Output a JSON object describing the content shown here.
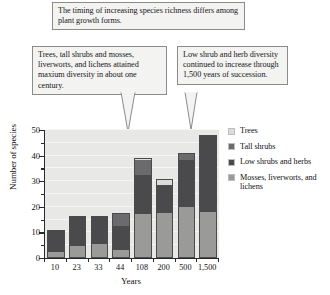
{
  "callouts": [
    {
      "id": "top",
      "text": "The timing of increasing species richness differs among plant growth forms."
    },
    {
      "id": "left",
      "text": "Trees, tall shrubs and mosses, liverworts, and lichens attained maxium diversity in about one century."
    },
    {
      "id": "right",
      "text": "Low shrub and herb diversity continued to increase through 1,500 years of succession."
    }
  ],
  "legend": {
    "items": [
      {
        "label": "Trees",
        "color": "#dcdcd9"
      },
      {
        "label": "Tall shrubs",
        "color": "#6b6b6e"
      },
      {
        "label": "Low shrubs and herbs",
        "color": "#4a4a4d"
      },
      {
        "label": "Mosses, liverworts, and lichens",
        "color": "#9a9a98"
      }
    ]
  },
  "chart_data": {
    "type": "bar",
    "title": "",
    "xlabel": "Years",
    "ylabel": "Number of species",
    "ylim": [
      0,
      50
    ],
    "yticks": [
      0,
      10,
      20,
      30,
      40,
      50
    ],
    "yminor": [
      5,
      15,
      25,
      35,
      45
    ],
    "grid": true,
    "stacked": true,
    "legend_position": "right",
    "categories": [
      "10",
      "23",
      "33",
      "44",
      "108",
      "200",
      "500",
      "1,500"
    ],
    "series": [
      {
        "name": "Mosses, liverworts, and lichens",
        "color": "#9a9a98",
        "values": [
          2,
          4.5,
          5.5,
          3,
          17,
          17.5,
          20,
          18
        ]
      },
      {
        "name": "Low shrubs and herbs",
        "color": "#4a4a4d",
        "values": [
          9,
          12,
          11,
          9.5,
          15.5,
          11.5,
          18.5,
          30
        ]
      },
      {
        "name": "Tall shrubs",
        "color": "#6b6b6e",
        "values": [
          0,
          0,
          0,
          5,
          6,
          0,
          2.5,
          0
        ]
      },
      {
        "name": "Trees",
        "color": "#dcdcd9",
        "values": [
          0,
          0,
          0,
          0,
          0.5,
          2,
          0,
          0
        ]
      }
    ],
    "totals": [
      11,
      16.5,
      16.5,
      17.5,
      39,
      31,
      41,
      48
    ]
  }
}
